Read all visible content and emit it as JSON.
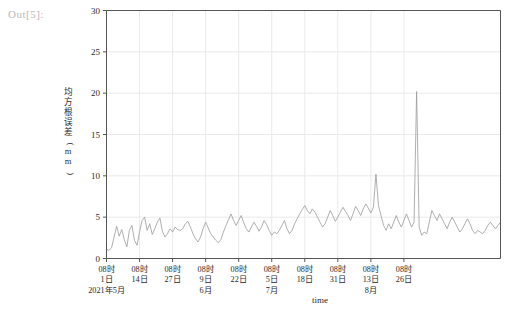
{
  "notebook": {
    "prompt_label": "Out[5]:"
  },
  "chart_data": {
    "type": "line",
    "title": "",
    "xlabel": "time",
    "ylabel": "均方根误差(mm)",
    "ylim": [
      0,
      30
    ],
    "yticks": [
      0,
      5,
      10,
      15,
      20,
      25,
      30
    ],
    "grid": true,
    "legend": null,
    "line_color": "#9a9a9a",
    "grid_color": "#e9e9e9",
    "axis_color": "#555555",
    "x_tick_labels": [
      {
        "hour": "08时",
        "day": "1日",
        "month": "2021年5月"
      },
      {
        "hour": "08时",
        "day": "14日",
        "month": ""
      },
      {
        "hour": "08时",
        "day": "27日",
        "month": ""
      },
      {
        "hour": "08时",
        "day": "9日",
        "month": "6月"
      },
      {
        "hour": "08时",
        "day": "22日",
        "month": ""
      },
      {
        "hour": "08时",
        "day": "5日",
        "month": "7月"
      },
      {
        "hour": "08时",
        "day": "18日",
        "month": ""
      },
      {
        "hour": "08时",
        "day": "31日",
        "month": ""
      },
      {
        "hour": "08时",
        "day": "13日",
        "month": "8月"
      },
      {
        "hour": "08时",
        "day": "26日",
        "month": ""
      }
    ],
    "x_tick_indices": [
      0,
      13,
      26,
      39,
      52,
      65,
      78,
      91,
      104,
      117
    ],
    "x_start": "2021-05-01 08时",
    "x_count": 128,
    "values": [
      1.1,
      1.0,
      1.3,
      2.6,
      3.9,
      2.7,
      3.5,
      2.3,
      1.4,
      3.4,
      4.0,
      2.2,
      1.6,
      3.2,
      4.6,
      5.0,
      3.4,
      4.2,
      2.9,
      3.6,
      4.4,
      4.9,
      3.3,
      2.6,
      3.0,
      3.6,
      3.2,
      3.8,
      3.5,
      3.4,
      3.6,
      4.2,
      4.5,
      3.8,
      3.0,
      2.4,
      2.0,
      2.6,
      3.6,
      4.4,
      3.7,
      3.0,
      2.6,
      2.2,
      1.9,
      2.3,
      3.2,
      4.0,
      4.7,
      5.4,
      4.6,
      4.0,
      4.6,
      5.2,
      4.3,
      3.6,
      3.2,
      3.8,
      4.4,
      3.9,
      3.3,
      3.8,
      4.6,
      4.1,
      3.4,
      2.8,
      3.2,
      3.0,
      3.4,
      4.0,
      4.6,
      3.6,
      3.0,
      3.4,
      4.2,
      4.8,
      5.4,
      5.9,
      6.4,
      5.8,
      5.4,
      6.0,
      5.6,
      5.0,
      4.4,
      3.8,
      4.2,
      5.0,
      5.8,
      5.2,
      4.5,
      5.0,
      5.6,
      6.2,
      5.7,
      5.2,
      4.6,
      5.4,
      6.3,
      5.8,
      5.2,
      6.0,
      6.6,
      6.1,
      5.5,
      6.2,
      10.2,
      6.4,
      5.2,
      4.0,
      3.4,
      4.2,
      3.6,
      4.4,
      5.2,
      4.4,
      3.8,
      4.6,
      5.4,
      4.6,
      3.8,
      4.4,
      20.2,
      3.8,
      2.8,
      3.2,
      3.0,
      4.4
    ],
    "values_tail": [
      5.8,
      5.2,
      4.6,
      5.4,
      4.8,
      4.2,
      3.6,
      4.4,
      5.0,
      4.4,
      3.8,
      3.2,
      3.6,
      4.2,
      4.8,
      4.2,
      3.4,
      3.0,
      3.4,
      3.2,
      3.0,
      3.4,
      4.0,
      4.4,
      4.0,
      3.6,
      4.0,
      4.4
    ],
    "annotations": [
      {
        "label": "major peak",
        "value": 20.2
      },
      {
        "label": "secondary peak",
        "value": 10.2
      }
    ]
  }
}
